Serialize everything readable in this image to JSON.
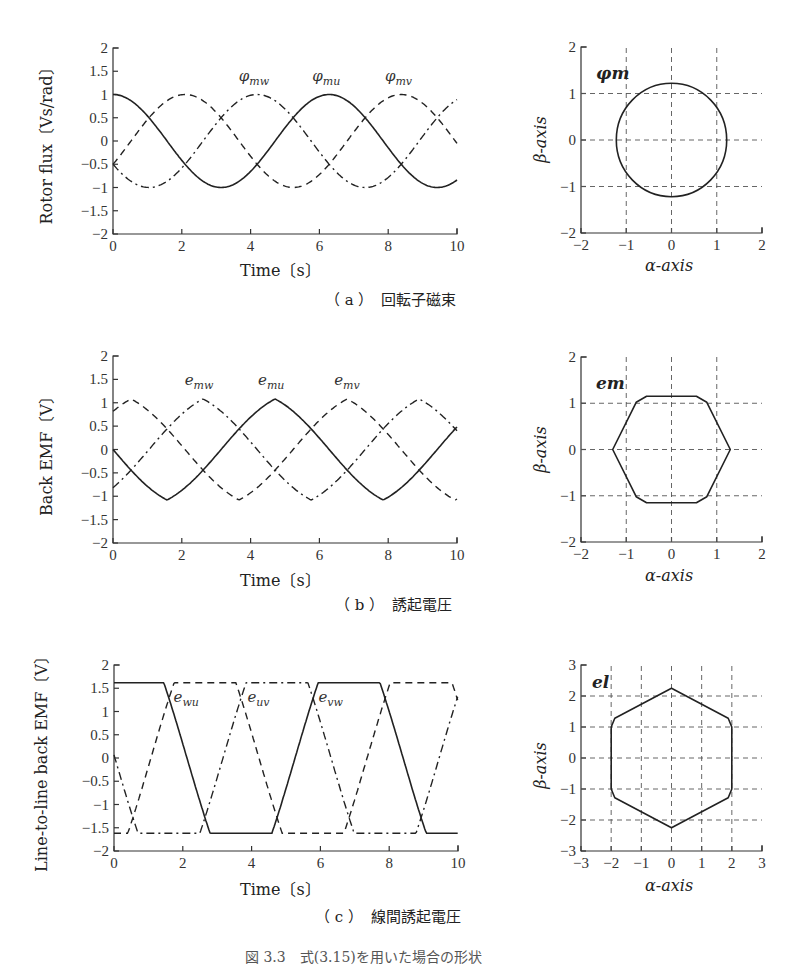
{
  "figure": {
    "caption_a": "（ a ）　回転子磁束",
    "caption_b": "（ b ）　誘起電圧",
    "caption_c": "（ c ）　線間誘起電圧",
    "caption_figure": "図 3.3　式(3.15)を用いた場合の形状"
  },
  "panels": {
    "a_left": {
      "ylabel": "Rotor flux〔Vs/rad〕",
      "xlabel": "Time〔s〕"
    },
    "a_right": {
      "tag": "φm",
      "xlabel": "α-axis",
      "ylabel": "β-axis"
    },
    "b_left": {
      "ylabel": "Back EMF〔V〕",
      "xlabel": "Time〔s〕"
    },
    "b_right": {
      "tag": "em",
      "xlabel": "α-axis",
      "ylabel": "β-axis"
    },
    "c_left": {
      "ylabel": "Line-to-line back EMF〔V〕",
      "xlabel": "Time〔s〕"
    },
    "c_right": {
      "tag": "el",
      "xlabel": "α-axis",
      "ylabel": "β-axis"
    }
  },
  "chart_data": [
    {
      "id": "a_time",
      "type": "line",
      "title": "(a) 回転子磁束",
      "xlabel": "Time〔s〕",
      "ylabel": "Rotor flux〔Vs/rad〕",
      "xlim": [
        0,
        10
      ],
      "ylim": [
        -2,
        2
      ],
      "xticks": [
        0,
        2,
        4,
        6,
        8,
        10
      ],
      "yticks": [
        -2,
        -1.5,
        -1,
        -0.5,
        0,
        0.5,
        1,
        1.5,
        2
      ],
      "ytick_labels": [
        "−2",
        "−1.5",
        "−1",
        "−0.5",
        "0",
        "0.5",
        "1",
        "1.5",
        "2"
      ],
      "grid": false,
      "series": [
        {
          "name": "φmu",
          "style": "solid",
          "amplitude": 1.0,
          "phase_deg": 0,
          "shape": "cos"
        },
        {
          "name": "φmv",
          "style": "dashed",
          "amplitude": 1.0,
          "phase_deg": -120,
          "shape": "cos"
        },
        {
          "name": "φmw",
          "style": "dash-dot",
          "amplitude": 1.0,
          "phase_deg": 120,
          "shape": "cos"
        }
      ],
      "annotations": [
        {
          "text": "φmw",
          "x": 4.1,
          "y": 1.3
        },
        {
          "text": "φmu",
          "x": 6.2,
          "y": 1.3
        },
        {
          "text": "φmv",
          "x": 8.3,
          "y": 1.3
        }
      ]
    },
    {
      "id": "a_ab",
      "type": "line",
      "title": "φm",
      "xlabel": "α-axis",
      "ylabel": "β-axis",
      "xlim": [
        -2,
        2
      ],
      "ylim": [
        -2,
        2
      ],
      "xticks": [
        -2,
        -1,
        0,
        1,
        2
      ],
      "yticks": [
        -2,
        -1,
        0,
        1,
        2
      ],
      "grid": true,
      "series": [
        {
          "name": "φm locus",
          "shape": "circle",
          "radius": 1.22
        }
      ]
    },
    {
      "id": "b_time",
      "type": "line",
      "title": "(b) 誘起電圧",
      "xlabel": "Time〔s〕",
      "ylabel": "Back EMF〔V〕",
      "xlim": [
        0,
        10
      ],
      "ylim": [
        -2,
        2
      ],
      "xticks": [
        0,
        2,
        4,
        6,
        8,
        10
      ],
      "yticks": [
        -2,
        -1.5,
        -1,
        -0.5,
        0,
        0.5,
        1,
        1.5,
        2
      ],
      "ytick_labels": [
        "−2",
        "−1.5",
        "−1",
        "−0.5",
        "0",
        "0.5",
        "1",
        "1.5",
        "2"
      ],
      "grid": false,
      "peak": 1.08,
      "series": [
        {
          "name": "emu",
          "style": "solid",
          "phase_deg": 0,
          "shape": "-sin-trapezoidal"
        },
        {
          "name": "emv",
          "style": "dashed",
          "phase_deg": -120,
          "shape": "-sin-trapezoidal"
        },
        {
          "name": "emw",
          "style": "dash-dot",
          "phase_deg": 120,
          "shape": "-sin-trapezoidal"
        }
      ],
      "annotations": [
        {
          "text": "emw",
          "x": 2.5,
          "y": 1.38
        },
        {
          "text": "emu",
          "x": 4.6,
          "y": 1.38
        },
        {
          "text": "emv",
          "x": 6.8,
          "y": 1.38
        }
      ]
    },
    {
      "id": "b_ab",
      "type": "line",
      "title": "em",
      "xlabel": "α-axis",
      "ylabel": "β-axis",
      "xlim": [
        -2,
        2
      ],
      "ylim": [
        -2,
        2
      ],
      "xticks": [
        -2,
        -1,
        0,
        1,
        2
      ],
      "yticks": [
        -2,
        -1,
        0,
        1,
        2
      ],
      "grid": true,
      "series": [
        {
          "name": "em locus",
          "shape": "hexagon (flat top/bottom)",
          "vertex_radius": 1.3,
          "flat_y": 1.15
        }
      ]
    },
    {
      "id": "c_time",
      "type": "line",
      "title": "(c) 線間誘起電圧",
      "xlabel": "Time〔s〕",
      "ylabel": "Line-to-line back EMF〔V〕",
      "xlim": [
        0,
        10
      ],
      "ylim": [
        -2,
        2
      ],
      "xticks": [
        0,
        2,
        4,
        6,
        8,
        10
      ],
      "yticks": [
        -2,
        -1.5,
        -1,
        -0.5,
        0,
        0.5,
        1,
        1.5,
        2
      ],
      "ytick_labels": [
        "−2",
        "−1.5",
        "−1",
        "−0.5",
        "0",
        "0.5",
        "1",
        "1.5",
        "2"
      ],
      "grid": false,
      "peak": 1.62,
      "series": [
        {
          "name": "euv",
          "style": "solid",
          "phase_deg": 0,
          "shape": "trapezoidal"
        },
        {
          "name": "evw",
          "style": "dashed",
          "phase_deg": -120,
          "shape": "trapezoidal"
        },
        {
          "name": "ewu",
          "style": "dash-dot",
          "phase_deg": 120,
          "shape": "trapezoidal"
        }
      ],
      "annotations": [
        {
          "text": "ewu",
          "x": 2.1,
          "y": 1.2
        },
        {
          "text": "euv",
          "x": 4.2,
          "y": 1.2
        },
        {
          "text": "evw",
          "x": 6.3,
          "y": 1.2
        }
      ]
    },
    {
      "id": "c_ab",
      "type": "line",
      "title": "el",
      "xlabel": "α-axis",
      "ylabel": "β-axis",
      "xlim": [
        -3,
        3
      ],
      "ylim": [
        -3,
        3
      ],
      "xticks": [
        -3,
        -2,
        -1,
        0,
        1,
        2,
        3
      ],
      "yticks": [
        -3,
        -2,
        -1,
        0,
        1,
        2,
        3
      ],
      "grid": true,
      "series": [
        {
          "name": "el locus",
          "shape": "hexagon (vertical sides)",
          "vertex_radius": 2.25,
          "flat_x": 2.0
        }
      ]
    }
  ]
}
